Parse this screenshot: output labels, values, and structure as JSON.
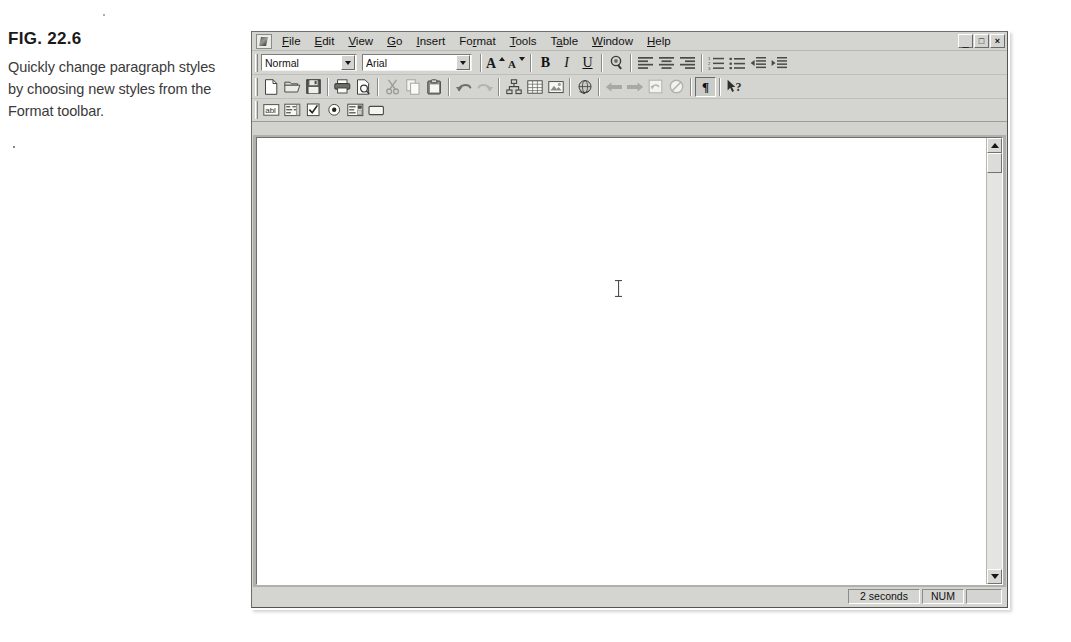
{
  "figure": {
    "number": "FIG. 22.6",
    "caption": "Quickly change paragraph styles by choosing new styles from the Format toolbar."
  },
  "window": {
    "app_icon": "document-app-icon",
    "controls": [
      {
        "name": "minimize",
        "glyph": "_"
      },
      {
        "name": "restore",
        "glyph": "□"
      },
      {
        "name": "close",
        "glyph": "×"
      }
    ]
  },
  "menubar": {
    "items": [
      {
        "label": "File",
        "pre": "",
        "key": "F",
        "post": "ile"
      },
      {
        "label": "Edit",
        "pre": "",
        "key": "E",
        "post": "dit"
      },
      {
        "label": "View",
        "pre": "",
        "key": "V",
        "post": "iew"
      },
      {
        "label": "Go",
        "pre": "",
        "key": "G",
        "post": "o"
      },
      {
        "label": "Insert",
        "pre": "",
        "key": "I",
        "post": "nsert"
      },
      {
        "label": "Format",
        "pre": "Fo",
        "key": "r",
        "post": "mat"
      },
      {
        "label": "Tools",
        "pre": "",
        "key": "T",
        "post": "ools"
      },
      {
        "label": "Table",
        "pre": "T",
        "key": "a",
        "post": "ble"
      },
      {
        "label": "Window",
        "pre": "",
        "key": "W",
        "post": "indow"
      },
      {
        "label": "Help",
        "pre": "",
        "key": "H",
        "post": "elp"
      }
    ]
  },
  "format_toolbar": {
    "style_combo": {
      "value": "Normal",
      "placeholder": "Style"
    },
    "font_combo": {
      "value": "Arial",
      "placeholder": "Font"
    },
    "buttons": [
      {
        "name": "increase-font-size-icon",
        "label": "A▴"
      },
      {
        "name": "decrease-font-size-icon",
        "label": "A▾"
      },
      {
        "name": "bold-icon",
        "label": "B"
      },
      {
        "name": "italic-icon",
        "label": "I"
      },
      {
        "name": "underline-icon",
        "label": "U"
      },
      {
        "name": "font-color-icon",
        "label": ""
      },
      {
        "name": "align-left-icon",
        "label": ""
      },
      {
        "name": "align-center-icon",
        "label": ""
      },
      {
        "name": "align-right-icon",
        "label": ""
      },
      {
        "name": "numbered-list-icon",
        "label": ""
      },
      {
        "name": "bulleted-list-icon",
        "label": ""
      },
      {
        "name": "decrease-indent-icon",
        "label": ""
      },
      {
        "name": "increase-indent-icon",
        "label": ""
      }
    ]
  },
  "standard_toolbar": {
    "buttons": [
      {
        "name": "new-document-icon"
      },
      {
        "name": "open-folder-icon"
      },
      {
        "name": "save-disk-icon"
      },
      {
        "name": "print-icon"
      },
      {
        "name": "print-preview-icon"
      },
      {
        "name": "cut-scissors-icon"
      },
      {
        "name": "copy-icon"
      },
      {
        "name": "paste-clipboard-icon"
      },
      {
        "name": "undo-icon"
      },
      {
        "name": "redo-icon"
      },
      {
        "name": "insert-hyperlink-icon"
      },
      {
        "name": "insert-table-icon"
      },
      {
        "name": "insert-picture-icon"
      },
      {
        "name": "web-globe-icon"
      },
      {
        "name": "back-arrow-icon"
      },
      {
        "name": "forward-arrow-icon"
      },
      {
        "name": "refresh-icon"
      },
      {
        "name": "stop-icon"
      },
      {
        "name": "show-paragraph-marks-icon",
        "label": "¶",
        "pressed": true
      },
      {
        "name": "help-pointer-icon",
        "label": "?"
      }
    ]
  },
  "forms_toolbar": {
    "buttons": [
      {
        "name": "text-box-icon",
        "label": "abl"
      },
      {
        "name": "scrolling-text-icon"
      },
      {
        "name": "check-box-icon"
      },
      {
        "name": "option-button-icon"
      },
      {
        "name": "drop-down-box-icon"
      },
      {
        "name": "command-button-icon"
      }
    ]
  },
  "document": {
    "content": "",
    "cursor": "text-ibeam-cursor"
  },
  "scrollbar": {
    "up": "scroll-up-arrow",
    "down": "scroll-down-arrow",
    "thumb": "scroll-thumb"
  },
  "statusbar": {
    "time": "2 seconds",
    "num_lock": "NUM",
    "end": ""
  },
  "colors": {
    "window_face": "#d4d4d0",
    "document_bg": "#ffffff",
    "frame_shadow": "#6e6e6e"
  }
}
